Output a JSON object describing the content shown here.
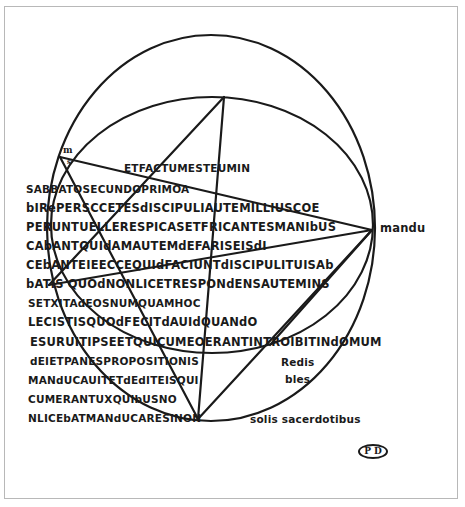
{
  "figure": {
    "stroke_color": "#1a1a1a",
    "background": "#ffffff",
    "frame_color": "#b8b8b8",
    "pentagram_points": {
      "top": [
        224,
        97
      ],
      "upper_left": [
        60,
        157
      ],
      "right": [
        372,
        230
      ],
      "lower_left": [
        49,
        285
      ],
      "bottom": [
        198,
        419
      ]
    }
  },
  "marks": {
    "corner_m": "m",
    "corner_s": "s"
  },
  "text_lines": [
    "ETFACTUMESTEUMIN",
    "SABBATOSECUNDOPRIMOA",
    "bIRePERSCCETESdISCIPULIAUTEMILLIUSCOE",
    "PERUNTUELLERESPICASETFRICANTESMANIbUS",
    "CAbANTQUIdAMAUTEMdEFARISEISdI",
    "CEbANTEIEECCEQUIdFACIUNTdISCIPULITUISAb",
    "bATIS QUOdNONLICETRESPONdENSAUTEMINS",
    "SETXITAdEOSNUMQUAMHOC",
    "LECISTISQUOdFECITdAUIdQUANdO",
    "ESURUITIPSEETQUICUMEOERANTINTROIBITINdOMUM",
    "dEIETPANESPROPOSITIONIS",
    "MANdUCAUITETdEdITEISQUI",
    "CUMERANTUXQUIbUSNO",
    "NLICEbATMANdUCARESINON"
  ],
  "right_text": {
    "mandu": "mandu",
    "redis": "Redis",
    "bles": "bles",
    "solis_sacerdotibus": "solis sacerdotibus"
  },
  "monogram": "P D"
}
